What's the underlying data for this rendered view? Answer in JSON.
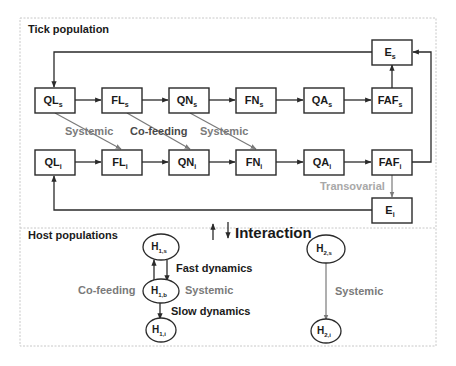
{
  "sections": {
    "tick_title": "Tick population",
    "host_title": "Host populations",
    "interaction_label": "Interaction"
  },
  "tick_nodes": {
    "susceptible": [
      {
        "id": "QLs",
        "main": "QL",
        "sub": "s"
      },
      {
        "id": "FLs",
        "main": "FL",
        "sub": "s"
      },
      {
        "id": "QNs",
        "main": "QN",
        "sub": "s"
      },
      {
        "id": "FNs",
        "main": "FN",
        "sub": "s"
      },
      {
        "id": "QAs",
        "main": "QA",
        "sub": "s"
      },
      {
        "id": "FAFs",
        "main": "FAF",
        "sub": "s"
      }
    ],
    "infected": [
      {
        "id": "QLi",
        "main": "QL",
        "sub": "i"
      },
      {
        "id": "FLi",
        "main": "FL",
        "sub": "i"
      },
      {
        "id": "QNi",
        "main": "QN",
        "sub": "i"
      },
      {
        "id": "FNi",
        "main": "FN",
        "sub": "i"
      },
      {
        "id": "QAi",
        "main": "QA",
        "sub": "i"
      },
      {
        "id": "FAFi",
        "main": "FAF",
        "sub": "i"
      }
    ],
    "eggs_s": {
      "id": "Es",
      "main": "E",
      "sub": "s"
    },
    "eggs_i": {
      "id": "Ei",
      "main": "E",
      "sub": "i"
    }
  },
  "tick_transmission_labels": {
    "systemic_1": "Systemic",
    "cofeeding": "Co-feeding",
    "systemic_2": "Systemic",
    "transovarial": "Transovarial"
  },
  "host_nodes": {
    "h1s": {
      "main": "H",
      "sub": "1,s"
    },
    "h1b": {
      "main": "H",
      "sub": "1,b"
    },
    "h1i": {
      "main": "H",
      "sub": "1,i"
    },
    "h2s": {
      "main": "H",
      "sub": "2,s"
    },
    "h2i": {
      "main": "H",
      "sub": "2,i"
    }
  },
  "host_labels": {
    "fast_dynamics": "Fast dynamics",
    "slow_dynamics": "Slow dynamics",
    "cofeeding": "Co-feeding",
    "systemic_h1": "Systemic",
    "systemic_h2": "Systemic"
  },
  "colors": {
    "dark": "#1a1a1a",
    "gray_label": "#7a7a7a",
    "light_gray_label": "#a8a8a8"
  }
}
